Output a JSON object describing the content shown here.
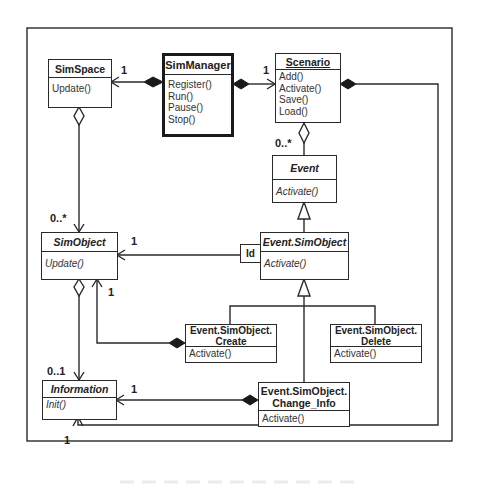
{
  "diagram": {
    "type": "UML class diagram",
    "classes": {
      "simspace": {
        "name": "SimSpace",
        "operations": [
          "Update()"
        ]
      },
      "simmanager": {
        "name": "SimManager",
        "operations": [
          "Register()",
          "Run()",
          "Pause()",
          "Stop()"
        ]
      },
      "scenario": {
        "name": "Scenario",
        "operations": [
          "Add()",
          "Activate()",
          "Save()",
          "Load()"
        ]
      },
      "event": {
        "name": "Event",
        "operations": [
          "Activate()"
        ],
        "abstract": true
      },
      "simobject": {
        "name": "SimObject",
        "operations": [
          "Update()"
        ],
        "abstract": true
      },
      "event_simobject": {
        "name": "Event.SimObject",
        "operations": [
          "Activate()"
        ],
        "abstract": true
      },
      "create": {
        "name_line1": "Event.SimObject.",
        "name_line2": "Create",
        "operations": [
          "Activate()"
        ]
      },
      "delete": {
        "name_line1": "Event.SimObject.",
        "name_line2": "Delete",
        "operations": [
          "Activate()"
        ]
      },
      "information": {
        "name": "Information",
        "operations": [
          "Init()"
        ],
        "abstract": true
      },
      "change_info": {
        "name_line1": "Event.SimObject.",
        "name_line2": "Change_Info",
        "operations": [
          "Activate()"
        ]
      }
    },
    "qualifier": {
      "label": "Id"
    },
    "multiplicities": {
      "simmanager_simspace": "1",
      "simmanager_scenario": "1",
      "scenario_event": "0..*",
      "simspace_simobject": "0..*",
      "evsimobj_simobject": "1",
      "create_simobject": "1",
      "simobject_information": "0..1",
      "changeinfo_information": "1",
      "scenario_information": "1"
    },
    "relationships": [
      {
        "from": "SimManager",
        "to": "SimSpace",
        "kind": "composition",
        "multiplicity": "1"
      },
      {
        "from": "SimManager",
        "to": "Scenario",
        "kind": "composition",
        "multiplicity": "1"
      },
      {
        "from": "Scenario",
        "to": "Event",
        "kind": "aggregation",
        "multiplicity": "0..*"
      },
      {
        "from": "SimSpace",
        "to": "SimObject",
        "kind": "aggregation",
        "multiplicity": "0..*"
      },
      {
        "from": "Event.SimObject",
        "to": "SimObject",
        "kind": "qualified association",
        "qualifier": "Id",
        "multiplicity": "1"
      },
      {
        "from": "Event.SimObject.Create",
        "to": "SimObject",
        "kind": "composition",
        "multiplicity": "1"
      },
      {
        "from": "SimObject",
        "to": "Information",
        "kind": "aggregation",
        "multiplicity": "0..1"
      },
      {
        "from": "Event.SimObject.Change_Info",
        "to": "Information",
        "kind": "composition",
        "multiplicity": "1"
      },
      {
        "from": "Scenario",
        "to": "Information",
        "kind": "composition",
        "multiplicity": "1"
      },
      {
        "from": "Event.SimObject",
        "to": "Event",
        "kind": "generalization"
      },
      {
        "from": "Event.SimObject.Create",
        "to": "Event.SimObject",
        "kind": "generalization"
      },
      {
        "from": "Event.SimObject.Delete",
        "to": "Event.SimObject",
        "kind": "generalization"
      },
      {
        "from": "Event.SimObject.Change_Info",
        "to": "Event.SimObject",
        "kind": "generalization"
      }
    ]
  },
  "colors": {
    "line": "#2a2a2a",
    "background": "#ffffff"
  }
}
